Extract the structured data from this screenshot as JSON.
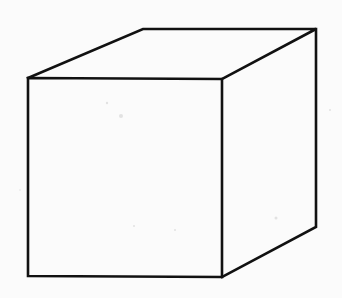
{
  "diagram": {
    "type": "wireframe-cube",
    "colors": {
      "background": "#fbfbfb",
      "stroke": "#111111"
    },
    "stroke_width": 2.6,
    "vertices": {
      "front_top_left": [
        28,
        78
      ],
      "front_top_right": [
        222,
        79
      ],
      "front_bottom_left": [
        28,
        276
      ],
      "front_bottom_right": [
        222,
        277
      ],
      "back_top_left": [
        143,
        29
      ],
      "back_top_right": [
        316,
        29
      ],
      "back_bottom_right": [
        316,
        227
      ]
    },
    "faces": [
      "front",
      "top",
      "right"
    ]
  }
}
